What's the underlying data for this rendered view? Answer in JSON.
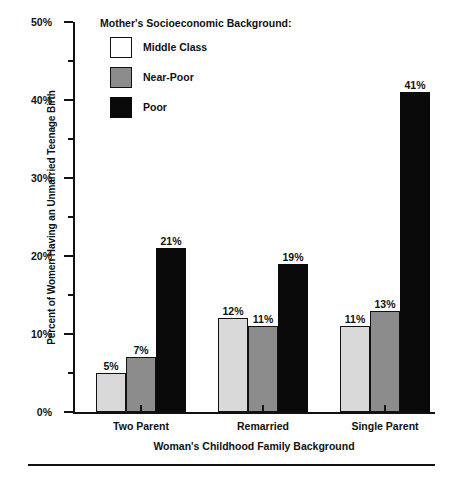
{
  "chart_data": {
    "type": "bar",
    "title": "",
    "xlabel": "Woman's Childhood Family Background",
    "ylabel": "Percent of Women Having an Unmarried Teenage Birth",
    "categories": [
      "Two Parent",
      "Remarried",
      "Single Parent"
    ],
    "series": [
      {
        "name": "Middle Class",
        "color": "#d9d9d9",
        "values": [
          5,
          12,
          11
        ],
        "labels": [
          "5%",
          "12%",
          "11%"
        ]
      },
      {
        "name": "Near-Poor",
        "color": "#8c8c8c",
        "values": [
          7,
          11,
          13
        ],
        "labels": [
          "7%",
          "11%",
          "13%"
        ]
      },
      {
        "name": "Poor",
        "color": "#0a0a0a",
        "values": [
          21,
          19,
          41
        ],
        "labels": [
          "21%",
          "19%",
          "41%"
        ]
      }
    ],
    "ylim": [
      0,
      50
    ],
    "ytick_values": [
      0,
      10,
      20,
      30,
      40,
      50
    ],
    "ytick_labels": [
      "0%",
      "10%",
      "20%",
      "30%",
      "40%",
      "50%"
    ],
    "yminor_tick_values": [
      5,
      15,
      25,
      35,
      45
    ],
    "grid": false,
    "legend_position": "inside-top-left"
  },
  "legend": {
    "title": "Mother's Socioeconomic Background:",
    "entries": [
      {
        "label": "Middle Class",
        "swatch": "white-square-icon"
      },
      {
        "label": "Near-Poor",
        "swatch": "gray-square-icon"
      },
      {
        "label": "Poor",
        "swatch": "black-square-icon"
      }
    ]
  },
  "axes": {
    "y_title": "Percent of Women Having an Unmarried Teenage Birth",
    "x_title": "Woman's Childhood Family Background",
    "y_ticks": [
      "0%",
      "10%",
      "20%",
      "30%",
      "40%",
      "50%"
    ],
    "x_ticks": [
      "Two Parent",
      "Remarried",
      "Single Parent"
    ]
  },
  "colors": {
    "ink": "#111111",
    "middle_class": "#d9d9d9",
    "near_poor": "#8c8c8c",
    "poor": "#0a0a0a",
    "background": "#ffffff"
  }
}
